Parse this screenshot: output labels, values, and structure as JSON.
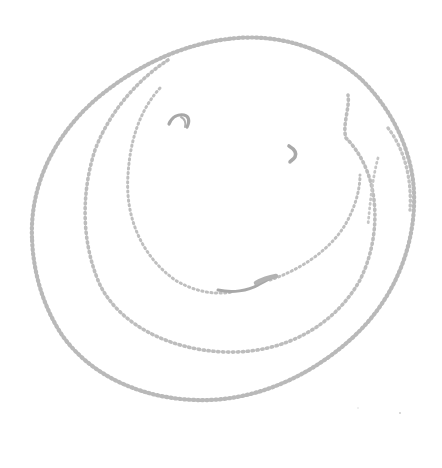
{
  "drawing": {
    "subject": "Hand-drawn stippled smiley face with spiral loops",
    "background": "#ffffff",
    "stroke_color": "#b8b8b8",
    "feature_color": "#a9a9a9",
    "loops": [
      {
        "name": "outer-loop",
        "stroke_width": 4,
        "dash": "1.5 3.2"
      },
      {
        "name": "middle-loop",
        "stroke_width": 3.5,
        "dash": "1.3 3.6"
      },
      {
        "name": "inner-loop",
        "stroke_width": 3,
        "dash": "1.2 3.4"
      }
    ],
    "features": {
      "left_eye": "curled eyebrow-like eye",
      "right_eye": "small angled eye",
      "mouth": "curved smile stroke"
    }
  }
}
